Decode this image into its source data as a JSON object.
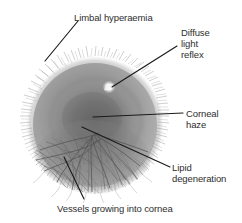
{
  "figure": {
    "kind": "annotated-clinical-photograph",
    "background_color": "#ffffff",
    "leader_line_color": "#1a1a1a",
    "label_text_color": "#2e2e2e"
  },
  "annotations": [
    {
      "id": "limbal-hyperaemia",
      "label": "Limbal hyperaemia",
      "leader": {
        "x1": 78,
        "y1": 21,
        "x2": 45,
        "y2": 61
      }
    },
    {
      "id": "diffuse-light-reflex",
      "label": "Diffuse\nlight\nreflex",
      "leader": {
        "x1": 177,
        "y1": 46,
        "x2": 112,
        "y2": 87
      }
    },
    {
      "id": "corneal-haze",
      "label": "Corneal\nhaze",
      "leader": {
        "x1": 183,
        "y1": 113,
        "x2": 93,
        "y2": 117
      }
    },
    {
      "id": "lipid-degeneration",
      "label": "Lipid\ndegeneration",
      "leader": {
        "x1": 170,
        "y1": 167,
        "x2": 82,
        "y2": 127
      }
    },
    {
      "id": "vessels-growing-into-cornea",
      "label": "Vessels growing into cornea",
      "leader": {
        "x1": 84,
        "y1": 199,
        "x2": 64,
        "y2": 157
      }
    }
  ],
  "eye": {
    "center_x": 95,
    "center_y": 125,
    "radius": 68,
    "limbal_ring_color": "#a9a9a9",
    "sclera_color": "#bdbdbd",
    "haze_color": "#6f6f6f",
    "cornea_color": "#8a8a8a",
    "light_reflex": {
      "x": 109,
      "y": 87,
      "r": 3.2,
      "color": "#fdfdfd"
    },
    "vessel_color": "#5c5c5c"
  }
}
